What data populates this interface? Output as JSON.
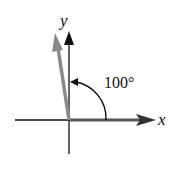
{
  "diagram": {
    "x_label": "x",
    "y_label": "y",
    "angle_label": "100°",
    "angle_degrees": 100,
    "colors": {
      "axes": "#111111",
      "x_vector": "#555555",
      "rotated_vector": "#8a8a8a",
      "arc": "#111111"
    }
  }
}
